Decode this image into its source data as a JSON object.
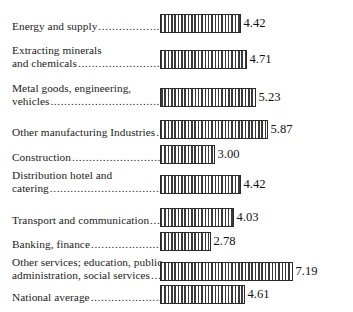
{
  "chart_data": {
    "type": "bar",
    "orientation": "horizontal",
    "title": "",
    "subtitle": "",
    "xlabel": "",
    "ylabel": "",
    "xlim": [
      0,
      7.19
    ],
    "grid": false,
    "legend": null,
    "value_labels": true,
    "leader_dots": true,
    "categories": [
      "Energy and supply",
      "Extracting minerals and chemicals",
      "Metal goods, engineering, vehicles",
      "Other manufacturing Industries",
      "Construction",
      "Distribution hotel and catering",
      "Transport and communication",
      "Banking, finance",
      "Other services; education, public administration, social services",
      "National average"
    ],
    "values": [
      4.42,
      4.71,
      5.23,
      5.87,
      3.0,
      4.42,
      4.03,
      2.78,
      7.19,
      4.61
    ],
    "value_text": [
      "4.42",
      "4.71",
      "5.23",
      "5.87",
      "3.00",
      "4.42",
      "4.03",
      "2.78",
      "7.19",
      "4.61"
    ]
  },
  "rows": [
    {
      "lines": [
        "Energy and supply"
      ],
      "leader": "..........................",
      "value": "4.42",
      "bar_px": 81,
      "top": 14
    },
    {
      "lines": [
        "Extracting minerals",
        "and chemicals"
      ],
      "leader": "..............................",
      "value": "4.71",
      "bar_px": 87,
      "top": 58
    },
    {
      "lines": [
        "Metal goods, engineering,",
        "vehicles"
      ],
      "leader": "........................................",
      "value": "5.23",
      "bar_px": 96,
      "top": 96
    },
    {
      "lines": [
        "Other manufacturing Industries"
      ],
      "leader": "....",
      "value": "5.87",
      "bar_px": 108,
      "top": 120
    },
    {
      "lines": [
        "Construction"
      ],
      "leader": "...................................",
      "value": "3.00",
      "bar_px": 55,
      "top": 145
    },
    {
      "lines": [
        "Distribution hotel and",
        "catering"
      ],
      "leader": "........................................",
      "value": "4.42",
      "bar_px": 81,
      "top": 183
    },
    {
      "lines": [
        "Transport and communication"
      ],
      "leader": "......",
      "value": "4.03",
      "bar_px": 74,
      "top": 208
    },
    {
      "lines": [
        "Banking, finance"
      ],
      "leader": ".............................",
      "value": "2.78",
      "bar_px": 51,
      "top": 232
    },
    {
      "lines": [
        "Other services; education, public",
        "administration, social services"
      ],
      "leader": "......",
      "value": "7.19",
      "bar_px": 133,
      "top": 270
    },
    {
      "lines": [
        "National average"
      ],
      "leader": "..............................",
      "value": "4.61",
      "bar_px": 85,
      "top": 285
    }
  ]
}
